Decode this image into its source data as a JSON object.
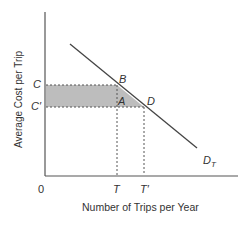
{
  "diagram": {
    "y_axis_label": "Average Cost per Trip",
    "x_axis_label": "Number of Trips per Year",
    "origin_label": "0",
    "y_ticks": {
      "C": "C",
      "C_prime": "C′"
    },
    "x_ticks": {
      "T": "T",
      "T_prime": "T′"
    },
    "points": {
      "A": "A",
      "B": "B",
      "D": "D"
    },
    "curve_label": "D",
    "curve_label_sub": "T",
    "colors": {
      "shade": "#bdbdbd",
      "line": "#444444",
      "axis": "#555555"
    }
  }
}
